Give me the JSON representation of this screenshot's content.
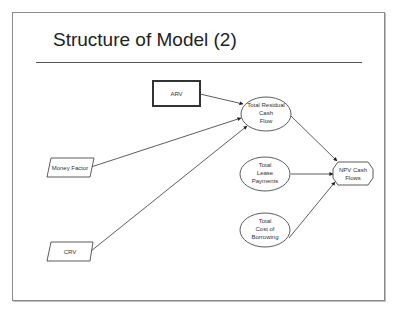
{
  "slide": {
    "title": "Structure of Model (2)"
  },
  "diagram": {
    "nodes": [
      {
        "id": "arv",
        "shape": "rectangle-bold",
        "lines": [
          "ARV"
        ]
      },
      {
        "id": "money_factor",
        "shape": "parallelogram",
        "lines": [
          "Money Factor"
        ]
      },
      {
        "id": "crv",
        "shape": "parallelogram",
        "lines": [
          "CRV"
        ]
      },
      {
        "id": "total_residual",
        "shape": "ellipse",
        "lines": [
          "Total Residual",
          "Cash",
          "Flow"
        ]
      },
      {
        "id": "total_lease",
        "shape": "ellipse",
        "lines": [
          "Total",
          "Lease",
          "Payments"
        ]
      },
      {
        "id": "total_cost",
        "shape": "ellipse",
        "lines": [
          "Total",
          "Cost of",
          "Borrowing"
        ]
      },
      {
        "id": "npv",
        "shape": "hexagon",
        "lines": [
          "NPV Cash",
          "Flows"
        ]
      }
    ],
    "edges": [
      {
        "from": "arv",
        "to": "total_residual"
      },
      {
        "from": "money_factor",
        "to": "total_residual"
      },
      {
        "from": "crv",
        "to": "total_residual"
      },
      {
        "from": "total_residual",
        "to": "npv"
      },
      {
        "from": "total_lease",
        "to": "npv"
      },
      {
        "from": "total_cost",
        "to": "npv"
      }
    ],
    "colors": {
      "stroke": "#333333",
      "background": "#ffffff"
    }
  }
}
